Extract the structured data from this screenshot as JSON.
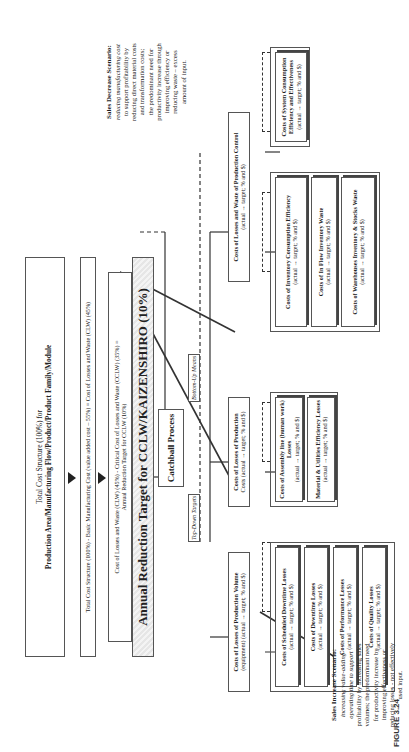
{
  "figure_label": "FIGURE 3.24",
  "top_stack": {
    "total_cost": {
      "line1": "Total Cost Structure (100%) for",
      "line2": "Production Area/Manufacturing Flow/Product/Product Family/Module"
    },
    "basic_cost": "Total Cost Structure (100%) - Basic Manufacturing Cost (value added cost – 55%) = Cost of Losses and Waste (CLW) (45%)",
    "critical_cost": {
      "line1": "Cost of Losses and Waste (CLW) (45%) - Critical Cost of Losses and Waste (CCLW) (35%) =",
      "line2": "Annual Reduction Target for CCLW (10%)"
    },
    "annual_target": "Annual Reduction Target for CCLW/KAIZENSHIRO (10%)"
  },
  "catchball": {
    "title": "Catchball Process",
    "top_down": "Top-Down Targets",
    "bottom_up": "Bottom-Up Means"
  },
  "scenarios": {
    "increase": {
      "title": "Sales Increase Scenario:",
      "lines": [
        "increasing value-adding",
        "operating time to support",
        "profitability by increasing sales",
        "volumes; the predominant need",
        "for productivity increase by",
        "improving effectiveness or",
        "reducing losses - not effectively",
        "used input."
      ]
    },
    "decrease": {
      "title": "Sales Decrease Scenario:",
      "lines": [
        "reducing manufacturing cost",
        "to support profitability by",
        "reducing direct material costs",
        "and transformation costs;",
        "the predominant need for",
        "productivity increase through",
        "improving efficiency or",
        "reducing waste – excess",
        "amount of input."
      ]
    }
  },
  "categories": [
    {
      "title": "Costs of Losses of Production Volume",
      "sub": "(equipment) (actual → target; % and $)",
      "items": [
        {
          "title": "Costs of Scheduled Downtime Losses",
          "sub": "(actual → target; % and $)"
        },
        {
          "title": "Costs of Downtime Losses",
          "sub": "(actual → target; % and $)"
        },
        {
          "title": "Costs of Performance Losses",
          "sub": "(actual → target; % and $)"
        },
        {
          "title": "Costs of Quality Losses",
          "sub": "(actual → target; % and $)"
        }
      ]
    },
    {
      "title": "Costs of Losses of Production",
      "sub": "Costs (actual → target; % and $)",
      "items": [
        {
          "title": "Costs of Assembly line (human work) Losses",
          "sub": "(actual → target; % and $)"
        },
        {
          "title": "Material & Utilities Efficiency Losses",
          "sub": "(actual → target; % and $)"
        }
      ]
    },
    {
      "title": "Costs of Losses and Waste of Production Control",
      "sub": "(actual → target; % and $)",
      "items": [
        {
          "title": "Costs of Inventory Consumption Efficiency",
          "sub": "(actual → target; % and $)"
        },
        {
          "title": "Costs of In Flow Inventory Waste",
          "sub": "(actual → target; % and $)"
        },
        {
          "title": "Costs of Warehouses Inventory & Stocks Waste",
          "sub": "(actual → target; % and $)"
        }
      ]
    },
    {
      "title": "",
      "sub": "",
      "items": [
        {
          "title": "Costs of System Consumption Efficiency and Effectiveness",
          "sub": "(actual → target; % and $)"
        }
      ]
    }
  ]
}
